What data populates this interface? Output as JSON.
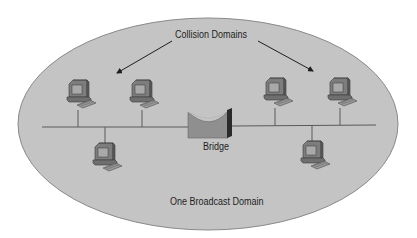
{
  "diagram": {
    "title_label": "Collision Domains",
    "bridge_label": "Bridge",
    "broadcast_label": "One Broadcast Domain",
    "colors": {
      "ellipse_fill": "#c4c4c4",
      "ellipse_stroke": "#8a8a8a",
      "bus_line": "#5a5a5a",
      "computer_body": "#7d7d7d",
      "bridge_fill": "#8f8f8f",
      "bridge_dark": "#2a2a2a"
    },
    "nodes": [
      {
        "id": "pc-1",
        "type": "computer",
        "x": 78,
        "y": 96,
        "side": "left",
        "position": "above-bus"
      },
      {
        "id": "pc-2",
        "type": "computer",
        "x": 142,
        "y": 96,
        "side": "left",
        "position": "above-bus"
      },
      {
        "id": "pc-3",
        "type": "computer",
        "x": 105,
        "y": 156,
        "side": "left",
        "position": "below-bus"
      },
      {
        "id": "pc-4",
        "type": "computer",
        "x": 275,
        "y": 94,
        "side": "right",
        "position": "above-bus"
      },
      {
        "id": "pc-5",
        "type": "computer",
        "x": 340,
        "y": 94,
        "side": "right",
        "position": "above-bus"
      },
      {
        "id": "pc-6",
        "type": "computer",
        "x": 312,
        "y": 154,
        "side": "right",
        "position": "below-bus"
      },
      {
        "id": "bridge",
        "type": "bridge",
        "x": 213,
        "y": 126
      }
    ]
  }
}
